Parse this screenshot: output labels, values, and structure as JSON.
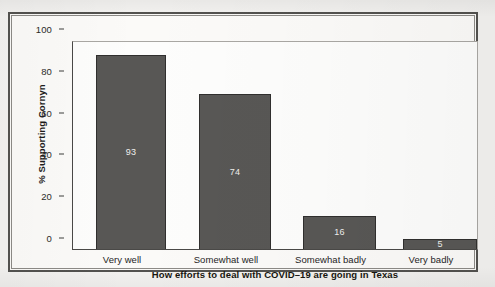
{
  "figure": {
    "background_color": "#f3f2f0",
    "panel_color": "#fbfaf8",
    "border_color": "#53524f"
  },
  "chart_data": {
    "type": "bar",
    "title": "",
    "xlabel": "How efforts to deal with COVID–19 are going in Texas",
    "ylabel": "% Supporting Cornyn",
    "categories": [
      "Very well",
      "Somewhat well",
      "Somewhat badly",
      "Very badly"
    ],
    "values": [
      93,
      74,
      16,
      5
    ],
    "value_labels": [
      "93",
      "74",
      "16",
      "5"
    ],
    "ylim": [
      0,
      100
    ],
    "yticks": [
      0,
      20,
      40,
      60,
      80,
      100
    ],
    "ytick_labels": [
      "0",
      "20",
      "40",
      "60",
      "80",
      "100"
    ],
    "grid": false,
    "legend": null,
    "bar_color": "#585755",
    "bar_edge_color": "#302f2e",
    "value_label_color": "#efefed"
  },
  "axes": {
    "y_title": "% Supporting Cornyn",
    "x_title": "How efforts to deal with COVID–19 are going in Texas",
    "ticks": {
      "y": [
        {
          "label": "100",
          "value": 100
        },
        {
          "label": "80",
          "value": 80
        },
        {
          "label": "60",
          "value": 60
        },
        {
          "label": "40",
          "value": 40
        },
        {
          "label": "20",
          "value": 20
        },
        {
          "label": "0",
          "value": 0
        }
      ]
    }
  },
  "bars": [
    {
      "category": "Very well",
      "value": 93,
      "label": "93"
    },
    {
      "category": "Somewhat well",
      "value": 74,
      "label": "74"
    },
    {
      "category": "Somewhat badly",
      "value": 16,
      "label": "16"
    },
    {
      "category": "Very badly",
      "value": 5,
      "label": "5"
    }
  ]
}
